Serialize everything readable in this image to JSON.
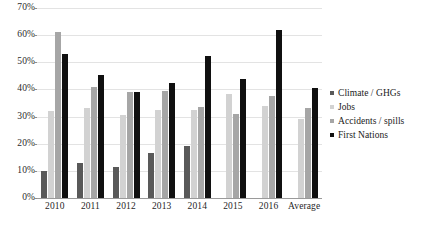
{
  "chart_data": {
    "type": "bar",
    "title": "",
    "xlabel": "",
    "ylabel": "",
    "ylim": [
      0,
      70
    ],
    "ytick_labels": [
      "0%",
      "10%",
      "20%",
      "30%",
      "40%",
      "50%",
      "60%",
      "70%"
    ],
    "ytick_values": [
      0,
      10,
      20,
      30,
      40,
      50,
      60,
      70
    ],
    "grid": true,
    "legend_position": "right",
    "categories": [
      "2010",
      "2011",
      "2012",
      "2013",
      "2014",
      "2015",
      "2016",
      "Average"
    ],
    "series": [
      {
        "name": "Climate / GHGs",
        "color": "#595959",
        "values": [
          10,
          13,
          11.5,
          16.5,
          19,
          0,
          0,
          0
        ]
      },
      {
        "name": "Jobs",
        "color": "#d2d2d2",
        "values": [
          32,
          33,
          30.5,
          32.5,
          32.5,
          38.5,
          34,
          29
        ]
      },
      {
        "name": "Accidents / spills",
        "color": "#a6a6a6",
        "values": [
          61,
          41,
          39,
          39.5,
          33.5,
          31,
          37.5,
          33
        ]
      },
      {
        "name": "First Nations",
        "color": "#101010",
        "values": [
          53,
          45.5,
          39,
          42.5,
          52.5,
          44,
          62,
          40.5
        ]
      }
    ],
    "series_sparse_note": "",
    "legend_entries": [
      "Climate / GHGs",
      "Jobs",
      "Accidents / spills",
      "First Nations"
    ]
  },
  "legend": {
    "items": [
      {
        "label": "Climate / GHGs",
        "color": "#595959"
      },
      {
        "label": "Jobs",
        "color": "#d2d2d2"
      },
      {
        "label": "Accidents / spills",
        "color": "#a6a6a6"
      },
      {
        "label": "First Nations",
        "color": "#101010"
      }
    ]
  },
  "colors": {
    "series_climate": "#595959",
    "series_jobs": "#d2d2d2",
    "series_accidents": "#a6a6a6",
    "series_first_nations": "#101010",
    "gridline": "#e3e3e3",
    "axis": "#9a9a9a",
    "background": "#ffffff"
  }
}
